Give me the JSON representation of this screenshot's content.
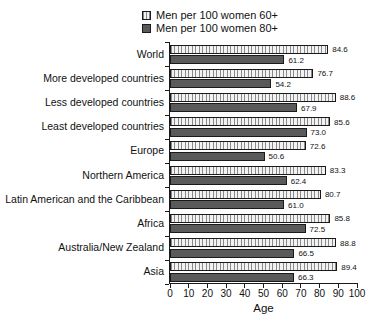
{
  "legend": {
    "items": [
      {
        "label": "Men per 100 women 60+",
        "style": "hatched"
      },
      {
        "label": "Men per 100 women 80+",
        "style": "solid"
      }
    ]
  },
  "chart_data": {
    "type": "bar",
    "orientation": "horizontal",
    "title": "",
    "xlabel": "Age",
    "xlim": [
      0,
      100
    ],
    "xticks": [
      0,
      10,
      20,
      30,
      40,
      50,
      60,
      70,
      80,
      90,
      100
    ],
    "grid": false,
    "legend_position": "top-center",
    "categories": [
      "World",
      "More developed countries",
      "Less developed countries",
      "Least developed countries",
      "Europe",
      "Northern America",
      "Latin American and the Caribbean",
      "Africa",
      "Australia/New Zealand",
      "Asia"
    ],
    "series": [
      {
        "name": "Men per 100 women 60+",
        "style": "hatched",
        "values": [
          84.6,
          76.7,
          88.6,
          85.6,
          72.6,
          83.3,
          80.7,
          85.8,
          88.8,
          89.4
        ]
      },
      {
        "name": "Men per 100 women 80+",
        "style": "solid",
        "values": [
          61.2,
          54.2,
          67.9,
          73.0,
          50.6,
          62.4,
          61.0,
          72.5,
          66.5,
          66.3
        ]
      }
    ],
    "value_label_decimals": 1,
    "colors": {
      "hatched_fill": "#f2f2f2",
      "hatch_line": "#8a8a8a",
      "solid_fill": "#5a5a5a",
      "bar_border": "#1a1a1a",
      "text": "#111111"
    }
  }
}
